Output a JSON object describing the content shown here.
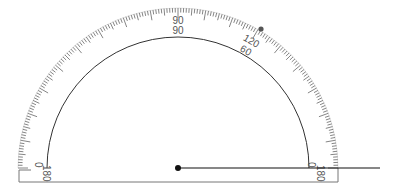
{
  "protractor": {
    "center": {
      "x": 178,
      "y": 168
    },
    "outer_radius": 160,
    "inner_arc_radius": 131,
    "base": {
      "left": 19,
      "right": 338,
      "bottom": 182
    },
    "outer_labels": {
      "deg0": "0",
      "deg90": "90",
      "deg120": "120",
      "deg180": "180"
    },
    "inner_labels": {
      "deg0": "0",
      "deg60": "60",
      "deg90": "90",
      "deg180": "180"
    },
    "colors": {
      "ticks": "#666666",
      "arc": "#333333",
      "frame": "#777777",
      "labels": "#555555"
    }
  },
  "measuring_arm": {
    "start": {
      "x": 178,
      "y": 168
    },
    "end": {
      "x": 380,
      "y": 168
    },
    "color": "#111111"
  },
  "marker_dot": {
    "x": 261,
    "y": 29,
    "color": "#555555",
    "angle_outer_scale": "121"
  }
}
